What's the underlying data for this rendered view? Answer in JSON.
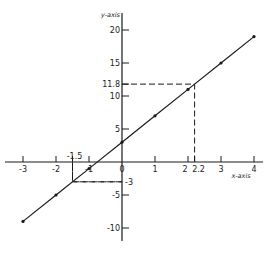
{
  "chart_data": {
    "type": "line",
    "title": "",
    "xlabel": "x-axis",
    "ylabel": "y-axis",
    "xlim": [
      -3,
      4
    ],
    "ylim": [
      -10,
      20
    ],
    "grid": false,
    "x_ticks": [
      {
        "value": -3,
        "label": "-3"
      },
      {
        "value": -2,
        "label": "-2"
      },
      {
        "value": -1,
        "label": "-1"
      },
      {
        "value": 0,
        "label": "0"
      },
      {
        "value": 1,
        "label": "1"
      },
      {
        "value": 2,
        "label": "2"
      },
      {
        "value": 2.2,
        "label": "2.2"
      },
      {
        "value": 3,
        "label": "3"
      },
      {
        "value": 4,
        "label": "4"
      }
    ],
    "x_annotation_ticks": [
      {
        "value": -1.5,
        "label": "-1.5"
      }
    ],
    "y_ticks": [
      {
        "value": 20,
        "label": "20"
      },
      {
        "value": 15,
        "label": "15"
      },
      {
        "value": 11.8,
        "label": "11.8"
      },
      {
        "value": 10,
        "label": "10"
      },
      {
        "value": 5,
        "label": "5"
      },
      {
        "value": -3,
        "label": "-3"
      },
      {
        "value": -5,
        "label": "-5"
      },
      {
        "value": -10,
        "label": "-10"
      }
    ],
    "series": [
      {
        "name": "y = 4x + 3",
        "x": [
          -3,
          -2,
          -1,
          0,
          1,
          2,
          3,
          4
        ],
        "y": [
          -9,
          -5,
          -1,
          3,
          7,
          11,
          15,
          19
        ]
      }
    ],
    "annotations": [
      {
        "type": "dashed-guide",
        "x": 2.2,
        "y": 11.8,
        "note": "x=2.2 maps to y=11.8"
      },
      {
        "type": "dashed-guide",
        "x": -1.5,
        "y": -3,
        "note": "y=-3 maps to x=-1.5"
      }
    ]
  }
}
